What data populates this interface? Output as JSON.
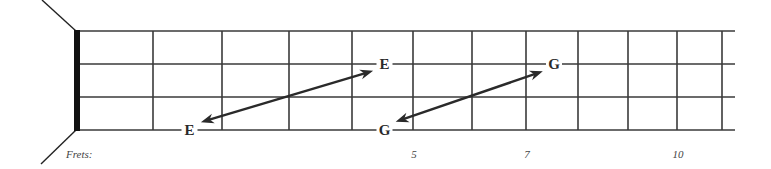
{
  "diagram": {
    "type": "guitar-fretboard-partial",
    "string_count": 4,
    "fret_count_shown": 11,
    "frets_caption": "Frets:",
    "fret_numbers": [
      {
        "fret": 5,
        "label": "5"
      },
      {
        "fret": 7,
        "label": "7"
      },
      {
        "fret": 10,
        "label": "10"
      }
    ],
    "notes": [
      {
        "id": "note-e-low",
        "label": "E",
        "string": 4,
        "fret": 2
      },
      {
        "id": "note-e-high",
        "label": "E",
        "string": 2,
        "fret": 5
      },
      {
        "id": "note-g-low",
        "label": "G",
        "string": 4,
        "fret": 5
      },
      {
        "id": "note-g-high",
        "label": "G",
        "string": 2,
        "fret": 8
      }
    ],
    "arrows": [
      {
        "id": "arrow-e-octave",
        "from": "note-e-low",
        "to": "note-e-high",
        "double_headed": true
      },
      {
        "id": "arrow-g-octave",
        "from": "note-g-low",
        "to": "note-g-high",
        "double_headed": true
      }
    ],
    "colors": {
      "line": "#3a3a3a",
      "nut": "#111111",
      "arrow": "#2a2a2a",
      "text": "#444444"
    }
  }
}
